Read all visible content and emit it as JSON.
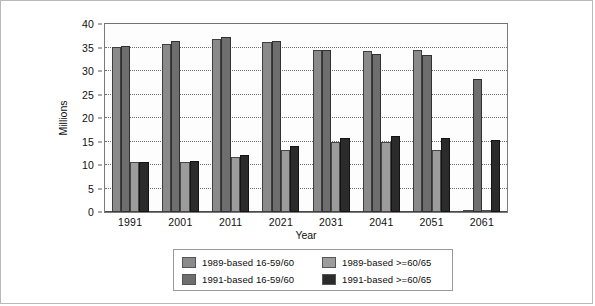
{
  "figure": {
    "background_color": "#ffffff",
    "border_color": "#b9b9b9"
  },
  "chart_data": {
    "type": "bar",
    "title": "",
    "subtitle": "",
    "xlabel": "Year",
    "ylabel": "Millions",
    "categories": [
      "1991",
      "2001",
      "2011",
      "2021",
      "2031",
      "2041",
      "2051",
      "2061"
    ],
    "ylim": [
      0,
      40
    ],
    "ytick_labels": [
      "0",
      "5",
      "10",
      "15",
      "20",
      "25",
      "30",
      "35",
      "40"
    ],
    "ytick_values": [
      0,
      5,
      10,
      15,
      20,
      25,
      30,
      35,
      40
    ],
    "grid": true,
    "grid_orientation": "horizontal",
    "grid_style": "dotted",
    "legend_position": "bottom",
    "legend_columns": 2,
    "bar_group_order": [
      "1989-based 16-59/60",
      "1991-based 16-59/60",
      "1989-based >=60/65",
      "1991-based >=60/65"
    ],
    "series": [
      {
        "name": "1989-based 16-59/60",
        "color": "#8a8a8a",
        "values": [
          35.2,
          35.8,
          36.8,
          36.2,
          34.5,
          34.2,
          34.4,
          null
        ]
      },
      {
        "name": "1991-based 16-59/60",
        "color": "#6e6e6e",
        "values": [
          35.3,
          36.4,
          37.2,
          36.4,
          34.5,
          33.7,
          33.4,
          28.4
        ]
      },
      {
        "name": "1989-based >=60/65",
        "color": "#9c9c9c",
        "values": [
          10.6,
          10.7,
          11.8,
          13.2,
          15.0,
          14.8,
          13.2,
          null
        ]
      },
      {
        "name": "1991-based >=60/65",
        "color": "#2b2b2b",
        "values": [
          10.7,
          10.8,
          12.2,
          14.0,
          15.8,
          16.2,
          15.7,
          15.4
        ]
      }
    ]
  },
  "legend": {
    "entries": [
      {
        "label": "1989-based 16-59/60",
        "color": "#8a8a8a"
      },
      {
        "label": "1991-based 16-59/60",
        "color": "#6e6e6e"
      },
      {
        "label": "1989-based >=60/65",
        "color": "#9c9c9c"
      },
      {
        "label": "1991-based >=60/65",
        "color": "#2b2b2b"
      }
    ]
  }
}
